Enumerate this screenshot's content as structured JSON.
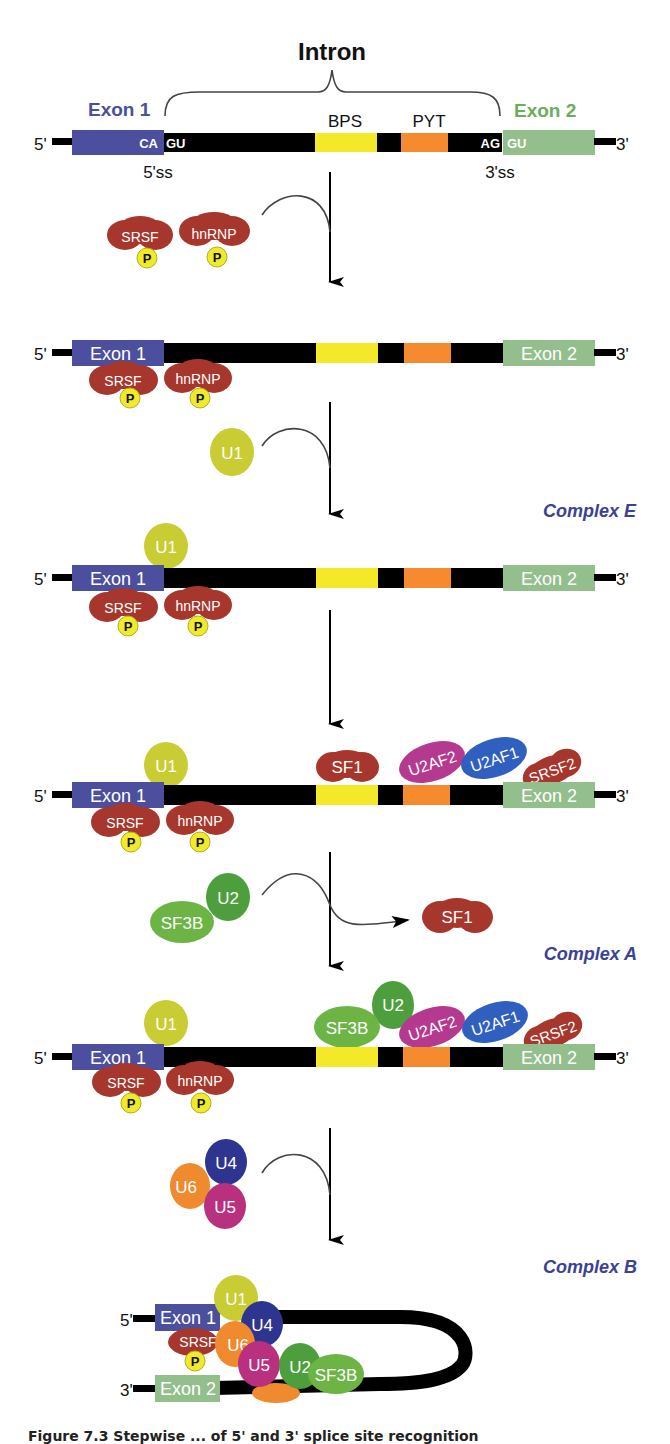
{
  "title": "Intron",
  "colors": {
    "exon1": "#4b4f9e",
    "exon1_label": "#4b4f9e",
    "exon2": "#93bf8c",
    "exon2_label": "#6aad5c",
    "intron": "#000000",
    "bps": "#f3e928",
    "pyt": "#f58a2e",
    "srsf": "#a7362c",
    "phospho": "#f0ea2c",
    "u1": "#c9cc33",
    "u2": "#4d9e3c",
    "sf3b": "#6cb544",
    "u2af2": "#b53a8f",
    "u2af1": "#2f5fbf",
    "u4": "#2e3590",
    "u5": "#b8307e",
    "u6": "#ef8a2e",
    "complex_label": "#3b4294"
  },
  "strand_labels": {
    "five_prime": "5'",
    "three_prime": "3'"
  },
  "stage1": {
    "exon1_label": "Exon 1",
    "exon2_label": "Exon 2",
    "bps_label": "BPS",
    "pyt_label": "PYT",
    "exon1_end": "CA",
    "intron_start": "GU",
    "intron_end": "AG",
    "exon2_start": "GU",
    "ss5_label": "5'ss",
    "ss3_label": "3'ss"
  },
  "exon_labels": {
    "exon1": "Exon 1",
    "exon2": "Exon 2"
  },
  "factors": {
    "srsf": "SRSF",
    "hnrnp": "hnRNP",
    "phospho": "P",
    "u1": "U1",
    "sf1": "SF1",
    "u2af2": "U2AF2",
    "u2af1": "U2AF1",
    "srsf2": "SRSF2",
    "u2": "U2",
    "sf3b": "SF3B",
    "u4": "U4",
    "u5": "U5",
    "u6": "U6"
  },
  "complexes": {
    "e": "Complex E",
    "a": "Complex A",
    "b": "Complex B"
  },
  "caption": "Figure 7.3   Stepwise ... of 5' and 3' splice site recognition"
}
